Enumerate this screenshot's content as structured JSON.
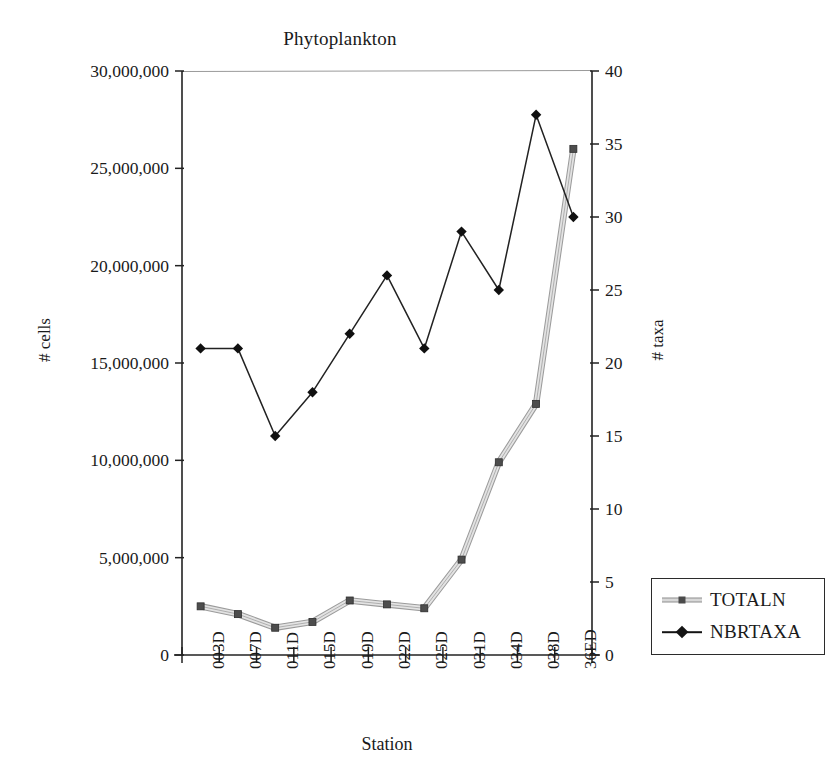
{
  "chart_data": {
    "type": "line",
    "title": "Phytoplankton",
    "xlabel": "Station",
    "ylabel": "# cells",
    "y2label": "# taxa",
    "categories": [
      "003D",
      "007D",
      "011D",
      "015D",
      "019D",
      "022D",
      "025D",
      "031D",
      "034D",
      "038D",
      "36ED"
    ],
    "ylim": [
      0,
      30000000
    ],
    "y2lim": [
      0,
      40
    ],
    "yticks": [
      0,
      5000000,
      10000000,
      15000000,
      20000000,
      25000000,
      30000000
    ],
    "ytick_labels": [
      "0",
      "5,000,000",
      "10,000,000",
      "15,000,000",
      "20,000,000",
      "25,000,000",
      "30,000,000"
    ],
    "y2ticks": [
      0,
      5,
      10,
      15,
      20,
      25,
      30,
      35,
      40
    ],
    "y2tick_labels": [
      "0",
      "5",
      "10",
      "15",
      "20",
      "25",
      "30",
      "35",
      "40"
    ],
    "grid": false,
    "legend_position": "right",
    "series": [
      {
        "name": "TOTALN",
        "axis": "left",
        "marker": "square",
        "color": "#c8c8c8",
        "values": [
          2500000,
          2100000,
          1400000,
          1700000,
          2800000,
          2600000,
          2400000,
          4900000,
          9900000,
          12900000,
          26000000
        ]
      },
      {
        "name": "NBRTAXA",
        "axis": "right",
        "marker": "diamond",
        "color": "#141414",
        "values": [
          21,
          21,
          15,
          18,
          22,
          26,
          21,
          29,
          25,
          37,
          30
        ]
      }
    ]
  },
  "legend": {
    "items": [
      {
        "label": "TOTALN"
      },
      {
        "label": "NBRTAXA"
      }
    ]
  }
}
